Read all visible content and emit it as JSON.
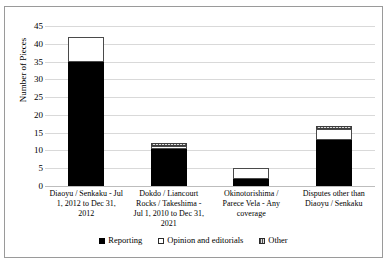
{
  "chart_data": {
    "type": "bar",
    "stacked": true,
    "title": "",
    "xlabel": "",
    "ylabel": "Number of Pieces",
    "ylim": [
      0,
      45
    ],
    "ytick_step": 5,
    "yticks": [
      0,
      5,
      10,
      15,
      20,
      25,
      30,
      35,
      40,
      45
    ],
    "grid": true,
    "legend_position": "bottom",
    "categories": [
      "Diaoyu / Senkaku - Jul 1, 2012 to Dec 31, 2012",
      "Dokdo / Liancourt Rocks / Takeshima - Jul 1, 2010 to Dec 31, 2021",
      "Okinotorishima / Parece Vela - Any coverage",
      "Disputes other than Diaoyu / Senkaku"
    ],
    "series": [
      {
        "name": "Reporting",
        "values": [
          35,
          10.5,
          2,
          13
        ],
        "color": "#000000"
      },
      {
        "name": "Opinion and editorials",
        "values": [
          7,
          0.8,
          3,
          3
        ],
        "color": "#ffffff"
      },
      {
        "name": "Other",
        "values": [
          0,
          0.7,
          0,
          1
        ],
        "color": "#c4c4c4"
      }
    ],
    "totals": [
      42,
      12,
      5,
      17
    ]
  },
  "axis": {
    "y_title": "Number of Pieces",
    "y_tick_labels": [
      "45",
      "40",
      "35",
      "30",
      "25",
      "20",
      "15",
      "10",
      "5",
      "0"
    ]
  },
  "legend": {
    "items": [
      {
        "label": "Reporting",
        "swatch": "reporting-swatch"
      },
      {
        "label": "Opinion and editorials",
        "swatch": "opinion-swatch"
      },
      {
        "label": "Other",
        "swatch": "other-swatch"
      }
    ]
  }
}
